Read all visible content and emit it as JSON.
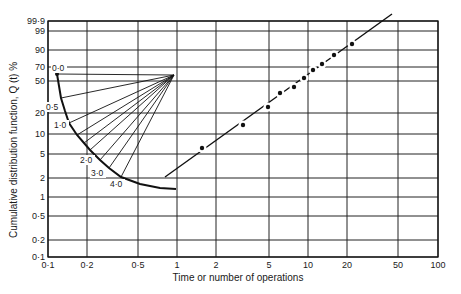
{
  "chart_data": {
    "type": "scatter",
    "title": "",
    "subtitle": "",
    "xlabel": "Time or number of operations",
    "ylabel": "Cumulative distribution function, Q (t) %",
    "xscale": "log",
    "yscale": "probability (normal)",
    "xlim": [
      0.1,
      100
    ],
    "ylim": [
      0.1,
      99.9
    ],
    "grid": true,
    "legend": null,
    "x_ticks": [
      {
        "value": 0.1,
        "label": "0·1"
      },
      {
        "value": 0.2,
        "label": "0·2"
      },
      {
        "value": 0.5,
        "label": "0·5"
      },
      {
        "value": 1,
        "label": "1"
      },
      {
        "value": 2,
        "label": "2"
      },
      {
        "value": 5,
        "label": "5"
      },
      {
        "value": 10,
        "label": "10"
      },
      {
        "value": 20,
        "label": "20"
      },
      {
        "value": 50,
        "label": "50"
      },
      {
        "value": 100,
        "label": "100"
      }
    ],
    "y_ticks": [
      {
        "value": 0.1,
        "label": "0·1"
      },
      {
        "value": 0.2,
        "label": "0·2"
      },
      {
        "value": 0.5,
        "label": "0·5"
      },
      {
        "value": 1,
        "label": "1"
      },
      {
        "value": 2,
        "label": "2"
      },
      {
        "value": 5,
        "label": "5"
      },
      {
        "value": 10,
        "label": "10"
      },
      {
        "value": 20,
        "label": "20"
      },
      {
        "value": 50,
        "label": "50"
      },
      {
        "value": 70,
        "label": "70"
      },
      {
        "value": 90,
        "label": "90"
      },
      {
        "value": 99,
        "label": "99"
      },
      {
        "value": 99.9,
        "label": "99·9"
      }
    ],
    "series": [
      {
        "name": "Observed data",
        "style": "points",
        "x": [
          1.6,
          3.2,
          5.0,
          6.0,
          8.0,
          9.5,
          11,
          13,
          16,
          22
        ],
        "y": [
          6,
          14,
          25,
          37,
          43,
          55,
          65,
          73,
          84,
          93
        ]
      },
      {
        "name": "Fitted line",
        "style": "line",
        "x": [
          1.3,
          37
        ],
        "y": [
          2.2,
          99.9
        ]
      }
    ],
    "shape_parameter_scale": {
      "description": "Beta (shape parameter) estimation arc with radial lines from focal point",
      "labels": [
        "0·0",
        "0·5",
        "1·0",
        "2·0",
        "3·0",
        "4·0"
      ],
      "focal_point_px": [
        174,
        75
      ]
    }
  },
  "render": {
    "x_pos": [
      48,
      87,
      138,
      177,
      216,
      269,
      308,
      347,
      398,
      438
    ],
    "y_pos": [
      257,
      240,
      216,
      197,
      178,
      154,
      134,
      113,
      81,
      67,
      50,
      31,
      21
    ],
    "frame": {
      "left": 48,
      "right": 438,
      "top": 21,
      "bottom": 257
    },
    "points_px": [
      [
        202,
        148
      ],
      [
        243,
        125
      ],
      [
        268,
        107
      ],
      [
        280,
        93
      ],
      [
        294,
        87
      ],
      [
        304,
        78
      ],
      [
        313,
        70
      ],
      [
        322,
        64
      ],
      [
        334,
        55
      ],
      [
        352,
        44
      ]
    ],
    "fit_line_px": [
      [
        165,
        177
      ],
      [
        392,
        14
      ]
    ],
    "curve_px": [
      [
        57,
        74
      ],
      [
        59,
        86
      ],
      [
        61,
        98
      ],
      [
        65,
        111
      ],
      [
        69,
        123
      ],
      [
        77,
        135
      ],
      [
        84,
        143
      ],
      [
        90,
        150
      ],
      [
        100,
        160
      ],
      [
        109,
        168
      ],
      [
        121,
        177
      ],
      [
        140,
        184
      ],
      [
        160,
        188
      ],
      [
        176,
        189
      ]
    ],
    "fan_targets_px": [
      [
        57,
        74
      ],
      [
        61,
        98
      ],
      [
        69,
        123
      ],
      [
        77,
        135
      ],
      [
        84,
        143
      ],
      [
        90,
        150
      ],
      [
        100,
        160
      ],
      [
        109,
        168
      ],
      [
        121,
        177
      ]
    ],
    "curve_labels_px": [
      {
        "text": "0·0",
        "x": 52,
        "y": 71,
        "anchor": "start"
      },
      {
        "text": "0·5",
        "x": 46,
        "y": 110,
        "anchor": "start"
      },
      {
        "text": "1·0",
        "x": 54,
        "y": 128,
        "anchor": "start"
      },
      {
        "text": "2·0",
        "x": 80,
        "y": 163,
        "anchor": "start"
      },
      {
        "text": "3·0",
        "x": 91,
        "y": 176,
        "anchor": "start"
      },
      {
        "text": "4·0",
        "x": 110,
        "y": 187,
        "anchor": "start"
      }
    ]
  }
}
